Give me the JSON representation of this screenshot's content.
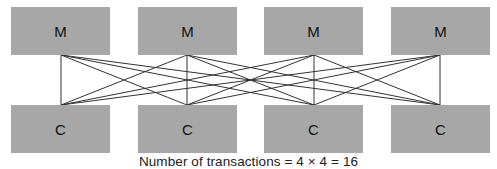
{
  "diagram": {
    "top_row": {
      "label": "M",
      "count": 4,
      "boxes": [
        {
          "label": "M"
        },
        {
          "label": "M"
        },
        {
          "label": "M"
        },
        {
          "label": "M"
        }
      ]
    },
    "bottom_row": {
      "label": "C",
      "count": 4,
      "boxes": [
        {
          "label": "C"
        },
        {
          "label": "C"
        },
        {
          "label": "C"
        },
        {
          "label": "C"
        }
      ]
    },
    "connections": "every M connected to every C (4 x 4 = 16 lines)",
    "caption": "Number of transactions = 4 × 4 = 16",
    "colors": {
      "box_fill": "#a7a7a7",
      "line": "#333333",
      "text": "#111111"
    }
  }
}
